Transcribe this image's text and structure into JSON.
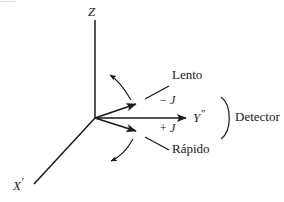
{
  "figure": {
    "type": "vector-diagram",
    "background_color": "#ffffff",
    "stroke_color": "#1a1a1a",
    "text_color": "#1a1a1a",
    "width": 284,
    "height": 202
  },
  "axes": [
    {
      "id": "z",
      "label": "Z",
      "label_x": 88,
      "label_y": 6,
      "from": [
        95,
        118
      ],
      "to": [
        95,
        20
      ],
      "arrow": false
    },
    {
      "id": "x-prime",
      "label": "X",
      "prime": "'",
      "label_x": 14,
      "label_y": 179,
      "from": [
        95,
        118
      ],
      "to": [
        34,
        184
      ],
      "arrow": false
    },
    {
      "id": "y-double-prime",
      "label": "Y",
      "prime": "″",
      "label_x": 194,
      "label_y": 110,
      "from": [
        95,
        118
      ],
      "to": [
        188,
        118
      ],
      "arrow": true
    }
  ],
  "vectors": [
    {
      "id": "slow-vector",
      "name": "lento",
      "from": [
        95,
        118
      ],
      "to": [
        139,
        103
      ],
      "arrow": true
    },
    {
      "id": "fast-vector",
      "name": "rapido",
      "from": [
        95,
        118
      ],
      "to": [
        139,
        132
      ],
      "arrow": true
    }
  ],
  "arcs": [
    {
      "id": "precession-arc-upper",
      "direction": "counterclockwise",
      "path": "M 131 100 C 124 88 118 80 109 74",
      "arrow_at": "end"
    },
    {
      "id": "precession-arc-lower",
      "direction": "clockwise",
      "path": "M 133 139 C 127 150 119 157 110 161",
      "arrow_at": "end"
    }
  ],
  "leaders": [
    {
      "id": "lento-leader",
      "from": [
        146,
        99
      ],
      "to": [
        170,
        86
      ]
    },
    {
      "id": "rapido-leader",
      "from": [
        146,
        138
      ],
      "to": [
        170,
        150
      ]
    }
  ],
  "detector_bracket": {
    "id": "detector-bracket",
    "path": "M 222 98 C 232 106 232 130 222 138"
  },
  "labels": {
    "slow": {
      "text": "Lento",
      "x": 172,
      "y": 70
    },
    "fast": {
      "text": "Rápido",
      "x": 172,
      "y": 144
    },
    "minus_j": {
      "text": "− J",
      "x": 160,
      "y": 96
    },
    "plus_j": {
      "text": "+ J",
      "x": 160,
      "y": 124
    },
    "detector": {
      "text": "Detector",
      "x": 236,
      "y": 111
    }
  },
  "ghost_caption_remnant": "......"
}
